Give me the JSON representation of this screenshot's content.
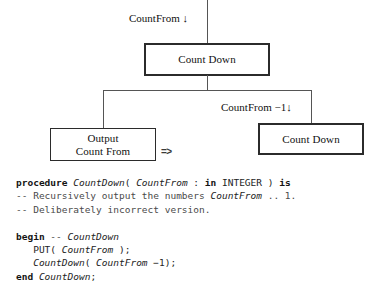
{
  "figure": {
    "kind": "structure-chart-with-code",
    "diagram": {
      "top_label": "CountFrom ↓",
      "nodes": [
        {
          "id": "root",
          "lines": [
            "Count Down"
          ],
          "style": "thick"
        },
        {
          "id": "output",
          "lines": [
            "Output",
            "Count From"
          ],
          "style": "plain"
        },
        {
          "id": "recursive",
          "lines": [
            "Count Down"
          ],
          "style": "thick"
        }
      ],
      "edge_label_right": "CountFrom −1↓",
      "implies_symbol": "=>"
    },
    "code": {
      "language": "Ada",
      "lines": [
        [
          {
            "t": "procedure ",
            "c": "kw"
          },
          {
            "t": "CountDown",
            "c": "id"
          },
          {
            "t": "( ",
            "c": "pl"
          },
          {
            "t": "CountFrom",
            "c": "id"
          },
          {
            "t": " : ",
            "c": "pl"
          },
          {
            "t": "in",
            "c": "kw"
          },
          {
            "t": " INTEGER ) ",
            "c": "pl"
          },
          {
            "t": "is",
            "c": "kw"
          }
        ],
        [
          {
            "t": "-- Recursively output the numbers ",
            "c": "cm"
          },
          {
            "t": "CountFrom",
            "c": "id"
          },
          {
            "t": " .. 1.",
            "c": "cm"
          }
        ],
        [
          {
            "t": "-- Deliberately incorrect version.",
            "c": "cm"
          }
        ],
        [],
        [
          {
            "t": "begin",
            "c": "kw"
          },
          {
            "t": " -- ",
            "c": "cm"
          },
          {
            "t": "CountDown",
            "c": "id"
          }
        ],
        [
          {
            "t": "   PUT( ",
            "c": "pl"
          },
          {
            "t": "CountFrom",
            "c": "id"
          },
          {
            "t": " );",
            "c": "pl"
          }
        ],
        [
          {
            "t": "   ",
            "c": "pl"
          },
          {
            "t": "CountDown",
            "c": "id"
          },
          {
            "t": "( ",
            "c": "pl"
          },
          {
            "t": "CountFrom",
            "c": "id"
          },
          {
            "t": " −1);",
            "c": "pl"
          }
        ],
        [
          {
            "t": "end ",
            "c": "kw"
          },
          {
            "t": "CountDown",
            "c": "id"
          },
          {
            "t": ";",
            "c": "pl"
          }
        ]
      ]
    }
  },
  "colors": {
    "ink": "#1a1a1a",
    "rule": "#555555",
    "box_border": "#2b2b2b",
    "comment": "#4a4a4a",
    "page": "#ffffff"
  }
}
